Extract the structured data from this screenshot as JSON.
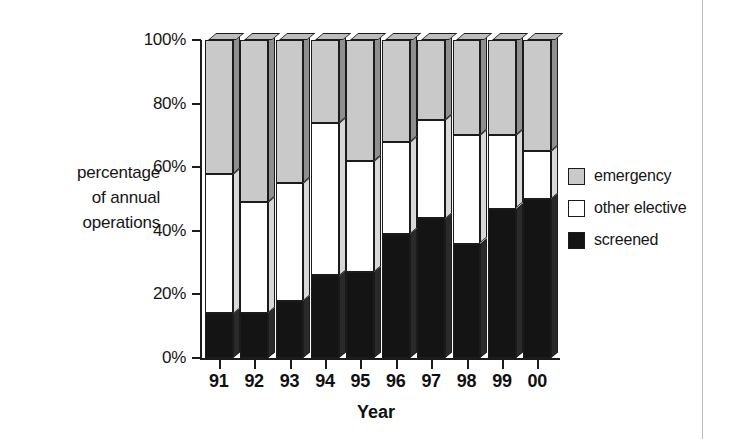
{
  "chart_data": {
    "type": "bar",
    "subtype": "stacked-percentage-column-3d",
    "title": "",
    "xlabel": "Year",
    "ylabel": "percentage of annual operations",
    "categories": [
      "91",
      "92",
      "93",
      "94",
      "95",
      "96",
      "97",
      "98",
      "99",
      "00"
    ],
    "ylim": [
      0,
      100
    ],
    "ytick_labels": [
      "0%",
      "20%",
      "40%",
      "60%",
      "80%",
      "100%"
    ],
    "ytick_values": [
      0,
      20,
      40,
      60,
      80,
      100
    ],
    "grid": false,
    "legend_position": "right",
    "series": [
      {
        "name": "screened",
        "color": "#141414",
        "values": [
          14,
          14,
          18,
          26,
          27,
          39,
          44,
          36,
          47,
          50
        ]
      },
      {
        "name": "other elective",
        "color": "#ffffff",
        "values": [
          44,
          35,
          37,
          48,
          35,
          29,
          31,
          34,
          23,
          15
        ]
      },
      {
        "name": "emergency",
        "color": "#c9c9c9",
        "values": [
          42,
          51,
          45,
          26,
          38,
          32,
          25,
          30,
          30,
          35
        ]
      }
    ],
    "cumulative_tops": {
      "screened": [
        14,
        14,
        18,
        26,
        27,
        39,
        44,
        36,
        47,
        50
      ],
      "elective": [
        58,
        49,
        55,
        74,
        62,
        68,
        75,
        70,
        70,
        65
      ],
      "emergency": [
        100,
        100,
        100,
        100,
        100,
        100,
        100,
        100,
        100,
        100
      ]
    }
  },
  "legend": {
    "items": [
      {
        "label": "emergency",
        "swatch": "emergency"
      },
      {
        "label": "other elective",
        "swatch": "elective"
      },
      {
        "label": "screened",
        "swatch": "screened"
      }
    ]
  },
  "axis": {
    "y_label_lines": [
      "percentage",
      "of annual",
      "operations"
    ],
    "x_title": "Year"
  },
  "colors": {
    "emergency": "#c9c9c9",
    "elective": "#ffffff",
    "screened": "#141414",
    "side_emergency": "#8f8f8f",
    "outline": "#1b1b1b"
  }
}
